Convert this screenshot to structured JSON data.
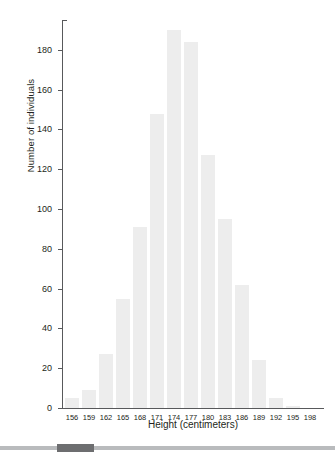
{
  "chart_data": {
    "type": "bar",
    "title": "",
    "subtitle": "",
    "xlabel": "Height (centimeters)",
    "ylabel": "Number of individuals",
    "categories": [
      "156",
      "159",
      "162",
      "165",
      "168",
      "171",
      "174",
      "177",
      "180",
      "183",
      "186",
      "189",
      "192",
      "195",
      "198"
    ],
    "values": [
      5,
      9,
      27,
      55,
      91,
      148,
      190,
      184,
      127,
      95,
      62,
      24,
      5,
      1,
      0
    ],
    "xlim": [
      154.5,
      199.5
    ],
    "ylim": [
      0,
      195
    ],
    "yticks": [
      "0",
      "20",
      "40",
      "60",
      "80",
      "100",
      "120",
      "140",
      "160",
      "180"
    ],
    "ytick_values": [
      0,
      20,
      40,
      60,
      80,
      100,
      120,
      140,
      160,
      180
    ],
    "xticks": [
      "156",
      "159",
      "162",
      "165",
      "168",
      "171",
      "174",
      "177",
      "180",
      "183",
      "186",
      "189",
      "192",
      "195",
      "198"
    ],
    "grid": false,
    "legend": null,
    "bar_color": "#ededed",
    "axis_color": "#58595b",
    "text_color": "#231f20",
    "annotations": []
  },
  "scrollbar": {
    "orientation": "horizontal",
    "track_color": "#b9bbbd",
    "thumb_color": "#6d6e70",
    "thumb_position_percent": 17,
    "thumb_width_percent": 11
  }
}
